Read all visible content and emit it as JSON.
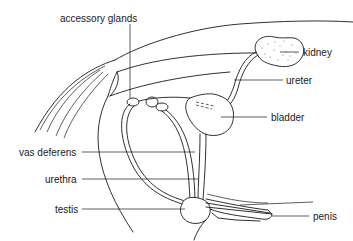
{
  "diagram": {
    "type": "anatomical-line-drawing",
    "colors": {
      "ink": "#1a1a1a",
      "background": "#ffffff"
    },
    "labels": {
      "accessory_glands": "accessory glands",
      "kidney": "kidney",
      "ureter": "ureter",
      "bladder": "bladder",
      "vas_deferens": "vas deferens",
      "urethra": "urethra",
      "testis": "testis",
      "penis": "penis"
    }
  }
}
